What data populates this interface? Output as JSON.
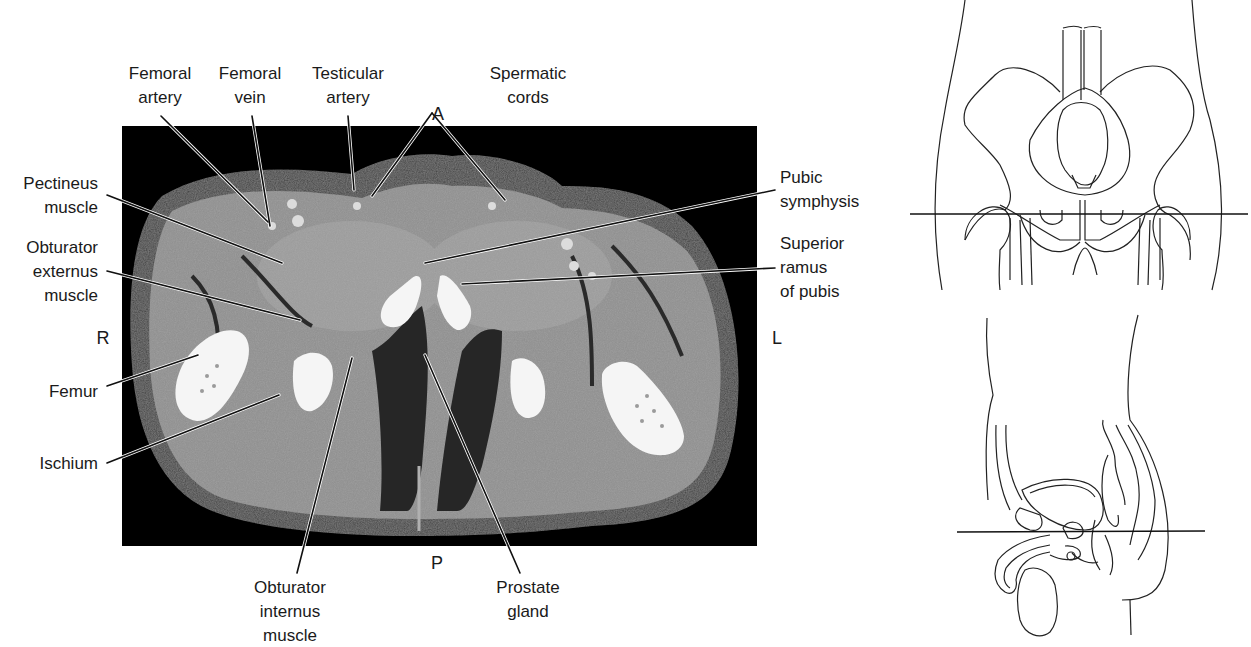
{
  "figure": {
    "orientation": {
      "anterior": "A",
      "posterior": "P",
      "right": "R",
      "left": "L"
    },
    "labels": {
      "femoral_artery": [
        "Femoral",
        "artery"
      ],
      "femoral_vein": [
        "Femoral",
        "vein"
      ],
      "testicular_artery": [
        "Testicular",
        "artery"
      ],
      "spermatic_cords": [
        "Spermatic",
        "cords"
      ],
      "pectineus_muscle": [
        "Pectineus",
        "muscle"
      ],
      "obturator_externus_muscle": [
        "Obturator",
        "externus",
        "muscle"
      ],
      "femur": [
        "Femur"
      ],
      "ischium": [
        "Ischium"
      ],
      "pubic_symphysis": [
        "Pubic",
        "symphysis"
      ],
      "superior_ramus_of_pubis": [
        "Superior",
        "ramus",
        "of pubis"
      ],
      "obturator_internus_muscle": [
        "Obturator",
        "internus",
        "muscle"
      ],
      "prostate_gland": [
        "Prostate",
        "gland"
      ]
    },
    "colors": {
      "background": "#ffffff",
      "ct_background": "#000000",
      "soft_tissue": "#8a8a8a",
      "muscle": "#9c9c9c",
      "fat": "#3a3a3a",
      "bone": "#f4f4f4",
      "line": "#111111"
    },
    "reference_diagrams": [
      "coronal-pelvis-outline-with-slice-line",
      "sagittal-male-pelvis-outline-with-slice-line"
    ]
  }
}
